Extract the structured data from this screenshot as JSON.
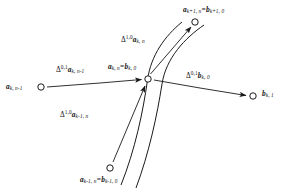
{
  "figure": {
    "domain": "diagram",
    "background_color": "#ffffff",
    "stroke_color": "#1a1a1a",
    "text_color": "#141414",
    "nodes": [
      {
        "id": "node-left",
        "label_key": "node_left",
        "x": 41,
        "y": 87
      },
      {
        "id": "node-center",
        "label_key": "node_center",
        "x": 148,
        "y": 79
      },
      {
        "id": "node-top",
        "label_key": "node_top",
        "x": 195,
        "y": 22
      },
      {
        "id": "node-right",
        "label_key": "node_right",
        "x": 253,
        "y": 96
      },
      {
        "id": "node-bottom",
        "label_key": "node_bottom",
        "x": 110,
        "y": 168
      }
    ],
    "labels": {
      "node_top": {
        "parts": [
          {
            "type": "bvar",
            "text": "a"
          },
          {
            "type": "sub",
            "text": "k+1, n"
          },
          {
            "type": "eq",
            "text": "="
          },
          {
            "type": "bvar",
            "text": "b"
          },
          {
            "type": "sub",
            "text": "k+1, 0"
          }
        ],
        "plain": "a_{k+1,n} = b_{k+1,0}"
      },
      "node_center": {
        "parts": [
          {
            "type": "bvar",
            "text": "a"
          },
          {
            "type": "sub",
            "text": "k, n"
          },
          {
            "type": "eq",
            "text": "="
          },
          {
            "type": "bvar",
            "text": "b"
          },
          {
            "type": "sub",
            "text": "k, 0"
          }
        ],
        "plain": "a_{k,n} = b_{k,0}"
      },
      "node_left": {
        "parts": [
          {
            "type": "bvar",
            "text": "a"
          },
          {
            "type": "sub",
            "text": "k, n-1"
          }
        ],
        "plain": "a_{k,n-1}"
      },
      "node_right": {
        "parts": [
          {
            "type": "bvar",
            "text": "b"
          },
          {
            "type": "sub",
            "text": "k, 1"
          }
        ],
        "plain": "b_{k,1}"
      },
      "node_bottom": {
        "parts": [
          {
            "type": "bvar",
            "text": "a"
          },
          {
            "type": "sub",
            "text": "k-1, n"
          },
          {
            "type": "eq",
            "text": "="
          },
          {
            "type": "bvar",
            "text": "b"
          },
          {
            "type": "sub",
            "text": "k-1, 0"
          }
        ],
        "plain": "a_{k-1,n} = b_{k-1,0}"
      },
      "delta_10_akn": {
        "parts": [
          {
            "type": "delta",
            "text": "Δ"
          },
          {
            "type": "sup",
            "text": "1,0"
          },
          {
            "type": "bvar",
            "text": "a"
          },
          {
            "type": "sub",
            "text": "k, n"
          }
        ],
        "plain": "Δ^{1,0} a_{k,n}"
      },
      "delta_01_aknm1": {
        "parts": [
          {
            "type": "delta",
            "text": "Δ"
          },
          {
            "type": "sup",
            "text": "0,1"
          },
          {
            "type": "bvar",
            "text": "a"
          },
          {
            "type": "sub",
            "text": "k, n-1"
          }
        ],
        "plain": "Δ^{0,1} a_{k,n-1}"
      },
      "delta_01_bk0": {
        "parts": [
          {
            "type": "delta",
            "text": "Δ"
          },
          {
            "type": "sup",
            "text": "0,1"
          },
          {
            "type": "bvar",
            "text": "b"
          },
          {
            "type": "sub",
            "text": "k, 0"
          }
        ],
        "plain": "Δ^{0,1} b_{k,0}"
      },
      "delta_10_akm1n": {
        "parts": [
          {
            "type": "delta",
            "text": "Δ"
          },
          {
            "type": "sup",
            "text": "1,0"
          },
          {
            "type": "bvar",
            "text": "a"
          },
          {
            "type": "sub",
            "text": "k-1, n"
          }
        ],
        "plain": "Δ^{1,0} a_{k-1,n}"
      }
    },
    "arrows": [
      {
        "id": "arrow-left-to-center",
        "from": "node-left",
        "to": "node-center",
        "label": "delta_01_aknm1"
      },
      {
        "id": "arrow-center-to-right",
        "from": "node-center",
        "to": "node-right",
        "label": "delta_01_bk0"
      },
      {
        "id": "arrow-center-to-top",
        "from": "node-center",
        "to": "node-top",
        "label": "delta_10_akn"
      },
      {
        "id": "arrow-bottom-to-center",
        "from": "node-bottom",
        "to": "node-center",
        "label": "delta_10_akm1n"
      }
    ],
    "curves": [
      {
        "id": "curve-left",
        "description": "curve through center node rising to upper right"
      },
      {
        "id": "curve-right",
        "description": "second curve offset to the right of the first"
      }
    ]
  }
}
